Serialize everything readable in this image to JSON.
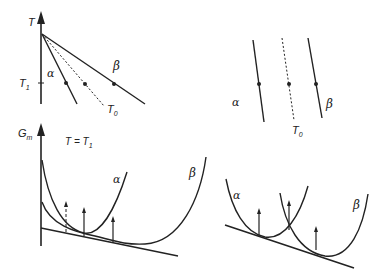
{
  "figure": {
    "top_left": {
      "title": "Phase diagram (temperature vs composition)",
      "axis_label": "T",
      "tick_label": "T",
      "tick_sub": "1",
      "alpha_label": "α",
      "beta_label": "β",
      "t0_label": "T",
      "t0_sub": "0"
    },
    "top_right": {
      "alpha_label": "α",
      "beta_label": "β",
      "t0_label": "T",
      "t0_sub": "0"
    },
    "bottom_left": {
      "axis_label": "G",
      "axis_sub": "m",
      "condition_label": "T = T",
      "condition_sub": "1",
      "alpha_label": "α",
      "beta_label": "β"
    },
    "bottom_right": {
      "alpha_label": "α",
      "beta_label": "β"
    }
  },
  "colors": {
    "line": "#222222",
    "background": "#ffffff"
  }
}
